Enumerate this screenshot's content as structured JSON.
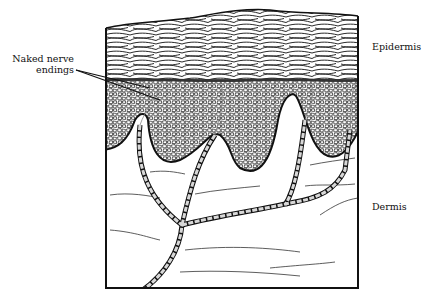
{
  "figure": {
    "labels": {
      "naked_nerve_line1": "Naked nerve",
      "naked_nerve_line2": "endings",
      "epidermis": "Epidermis",
      "dermis": "Dermis"
    },
    "colors": {
      "ink": "#111111",
      "nerve_fill": "#d8d8d8",
      "background": "#ffffff"
    }
  }
}
